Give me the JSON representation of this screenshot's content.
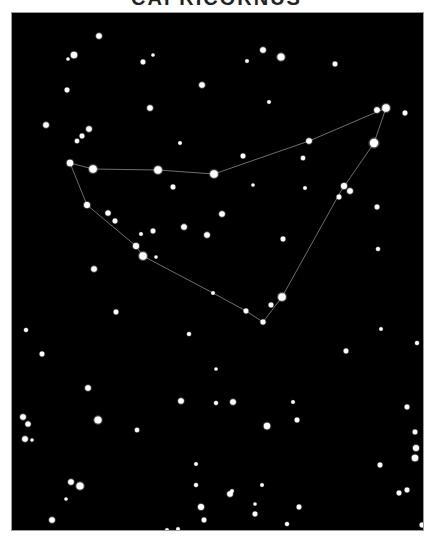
{
  "title": "CAPRICORNUS",
  "colors": {
    "background": "#000000",
    "frame_border": "#9a9a9a",
    "star": "#ffffff",
    "line": "#8a8a8a"
  },
  "constellation": {
    "name": "Capricornus",
    "lines": [
      [
        [
          69,
          162
        ],
        [
          92,
          168
        ],
        [
          157,
          169
        ],
        [
          213,
          173
        ],
        [
          308,
          140
        ],
        [
          385,
          107
        ],
        [
          373,
          142
        ],
        [
          340,
          190
        ],
        [
          281,
          296
        ],
        [
          262,
          321
        ],
        [
          245,
          310
        ],
        [
          212,
          292
        ],
        [
          142,
          255
        ],
        [
          135,
          245
        ],
        [
          86,
          204
        ],
        [
          69,
          162
        ]
      ]
    ],
    "stars": [
      {
        "x": 69,
        "y": 162,
        "r": 3.2
      },
      {
        "x": 92,
        "y": 168,
        "r": 3.8
      },
      {
        "x": 157,
        "y": 169,
        "r": 3.8
      },
      {
        "x": 213,
        "y": 173,
        "r": 3.8
      },
      {
        "x": 308,
        "y": 140,
        "r": 2.8
      },
      {
        "x": 385,
        "y": 107,
        "r": 3.8
      },
      {
        "x": 376,
        "y": 109,
        "r": 2.8
      },
      {
        "x": 373,
        "y": 142,
        "r": 4.2
      },
      {
        "x": 343,
        "y": 185,
        "r": 3.0
      },
      {
        "x": 349,
        "y": 190,
        "r": 2.8
      },
      {
        "x": 338,
        "y": 196,
        "r": 2.4
      },
      {
        "x": 281,
        "y": 296,
        "r": 3.8
      },
      {
        "x": 262,
        "y": 321,
        "r": 2.5
      },
      {
        "x": 245,
        "y": 310,
        "r": 2.4
      },
      {
        "x": 270,
        "y": 304,
        "r": 2.4
      },
      {
        "x": 212,
        "y": 292,
        "r": 1.8
      },
      {
        "x": 142,
        "y": 255,
        "r": 3.8
      },
      {
        "x": 135,
        "y": 245,
        "r": 3.0
      },
      {
        "x": 86,
        "y": 204,
        "r": 3.0
      },
      {
        "x": 107,
        "y": 212,
        "r": 2.6
      },
      {
        "x": 114,
        "y": 220,
        "r": 2.4
      },
      {
        "x": 140,
        "y": 233,
        "r": 1.8
      },
      {
        "x": 152,
        "y": 230,
        "r": 2.4
      },
      {
        "x": 155,
        "y": 256,
        "r": 1.6
      },
      {
        "x": 183,
        "y": 226,
        "r": 2.8
      },
      {
        "x": 206,
        "y": 234,
        "r": 2.8
      },
      {
        "x": 221,
        "y": 213,
        "r": 2.8
      },
      {
        "x": 172,
        "y": 186,
        "r": 2.4
      }
    ],
    "field_stars": [
      {
        "x": 98,
        "y": 35,
        "r": 2.8
      },
      {
        "x": 73,
        "y": 54,
        "r": 3.2
      },
      {
        "x": 67,
        "y": 58,
        "r": 1.6
      },
      {
        "x": 142,
        "y": 61,
        "r": 2.4
      },
      {
        "x": 152,
        "y": 54,
        "r": 1.6
      },
      {
        "x": 201,
        "y": 84,
        "r": 2.8
      },
      {
        "x": 66,
        "y": 89,
        "r": 2.4
      },
      {
        "x": 149,
        "y": 107,
        "r": 2.8
      },
      {
        "x": 262,
        "y": 49,
        "r": 2.8
      },
      {
        "x": 280,
        "y": 56,
        "r": 3.6
      },
      {
        "x": 246,
        "y": 60,
        "r": 1.8
      },
      {
        "x": 334,
        "y": 63,
        "r": 2.4
      },
      {
        "x": 268,
        "y": 101,
        "r": 1.8
      },
      {
        "x": 404,
        "y": 112,
        "r": 2.4
      },
      {
        "x": 45,
        "y": 124,
        "r": 2.8
      },
      {
        "x": 88,
        "y": 128,
        "r": 2.8
      },
      {
        "x": 81,
        "y": 135,
        "r": 2.4
      },
      {
        "x": 76,
        "y": 140,
        "r": 2.2
      },
      {
        "x": 179,
        "y": 142,
        "r": 1.8
      },
      {
        "x": 242,
        "y": 155,
        "r": 2.4
      },
      {
        "x": 302,
        "y": 157,
        "r": 2.2
      },
      {
        "x": 252,
        "y": 184,
        "r": 1.6
      },
      {
        "x": 304,
        "y": 187,
        "r": 1.8
      },
      {
        "x": 376,
        "y": 206,
        "r": 2.4
      },
      {
        "x": 282,
        "y": 238,
        "r": 2.4
      },
      {
        "x": 377,
        "y": 248,
        "r": 2.0
      },
      {
        "x": 93,
        "y": 268,
        "r": 2.8
      },
      {
        "x": 115,
        "y": 311,
        "r": 2.4
      },
      {
        "x": 380,
        "y": 328,
        "r": 1.8
      },
      {
        "x": 25,
        "y": 329,
        "r": 2.0
      },
      {
        "x": 188,
        "y": 333,
        "r": 2.0
      },
      {
        "x": 345,
        "y": 350,
        "r": 2.4
      },
      {
        "x": 41,
        "y": 353,
        "r": 2.4
      },
      {
        "x": 215,
        "y": 368,
        "r": 1.6
      },
      {
        "x": 416,
        "y": 342,
        "r": 2.0
      },
      {
        "x": 87,
        "y": 387,
        "r": 2.8
      },
      {
        "x": 180,
        "y": 400,
        "r": 2.8
      },
      {
        "x": 215,
        "y": 402,
        "r": 2.0
      },
      {
        "x": 232,
        "y": 401,
        "r": 2.8
      },
      {
        "x": 292,
        "y": 401,
        "r": 1.8
      },
      {
        "x": 97,
        "y": 419,
        "r": 3.6
      },
      {
        "x": 136,
        "y": 429,
        "r": 2.2
      },
      {
        "x": 266,
        "y": 425,
        "r": 3.2
      },
      {
        "x": 296,
        "y": 419,
        "r": 2.4
      },
      {
        "x": 22,
        "y": 416,
        "r": 2.8
      },
      {
        "x": 27,
        "y": 423,
        "r": 2.6
      },
      {
        "x": 24,
        "y": 438,
        "r": 2.8
      },
      {
        "x": 31,
        "y": 439,
        "r": 1.6
      },
      {
        "x": 406,
        "y": 406,
        "r": 2.4
      },
      {
        "x": 414,
        "y": 431,
        "r": 2.4
      },
      {
        "x": 415,
        "y": 447,
        "r": 3.0
      },
      {
        "x": 414,
        "y": 457,
        "r": 3.2
      },
      {
        "x": 195,
        "y": 463,
        "r": 1.8
      },
      {
        "x": 379,
        "y": 464,
        "r": 2.4
      },
      {
        "x": 70,
        "y": 481,
        "r": 2.8
      },
      {
        "x": 79,
        "y": 485,
        "r": 3.6
      },
      {
        "x": 65,
        "y": 498,
        "r": 1.6
      },
      {
        "x": 195,
        "y": 484,
        "r": 2.0
      },
      {
        "x": 261,
        "y": 484,
        "r": 1.8
      },
      {
        "x": 298,
        "y": 506,
        "r": 2.4
      },
      {
        "x": 229,
        "y": 493,
        "r": 2.8
      },
      {
        "x": 231,
        "y": 490,
        "r": 1.8
      },
      {
        "x": 51,
        "y": 519,
        "r": 2.8
      },
      {
        "x": 200,
        "y": 506,
        "r": 3.0
      },
      {
        "x": 203,
        "y": 519,
        "r": 2.4
      },
      {
        "x": 254,
        "y": 513,
        "r": 2.4
      },
      {
        "x": 254,
        "y": 503,
        "r": 1.6
      },
      {
        "x": 398,
        "y": 492,
        "r": 2.4
      },
      {
        "x": 406,
        "y": 489,
        "r": 2.4
      },
      {
        "x": 421,
        "y": 524,
        "r": 2.4
      },
      {
        "x": 166,
        "y": 529,
        "r": 1.8
      },
      {
        "x": 177,
        "y": 528,
        "r": 1.8
      },
      {
        "x": 246,
        "y": 536,
        "r": 1.6
      },
      {
        "x": 253,
        "y": 533,
        "r": 1.6
      },
      {
        "x": 286,
        "y": 523,
        "r": 2.0
      }
    ]
  }
}
